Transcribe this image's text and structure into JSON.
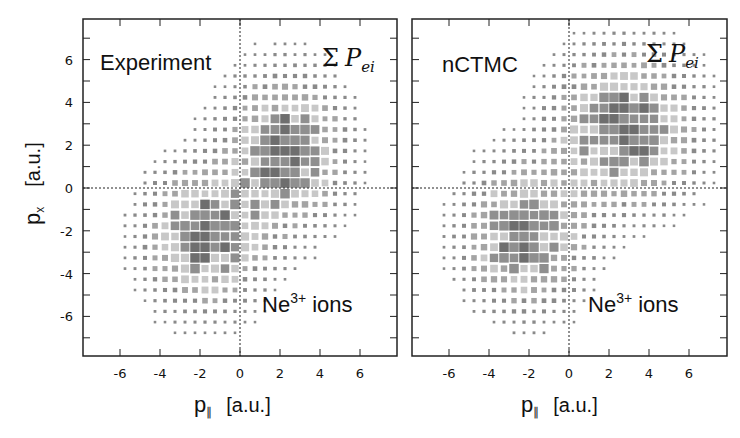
{
  "chart_data": [
    {
      "type": "heatmap",
      "title": "Experiment",
      "annotation_top": "Σ P_ei",
      "annotation_bottom": "Ne3+ ions",
      "xlabel": "p_∥ [a.u.]",
      "ylabel": "p_x [a.u.]",
      "xlim": [
        -8,
        8
      ],
      "ylim": [
        -8,
        8
      ],
      "xticks": [
        -6,
        -4,
        -2,
        0,
        2,
        4,
        6
      ],
      "yticks": [
        -6,
        -4,
        -2,
        0,
        2,
        4,
        6
      ],
      "bin_size": 0.5,
      "clusters": [
        {
          "center": [
            2.0,
            1.5
          ],
          "peak": [
            2.0,
            1.0
          ],
          "spread": [
            1.8,
            2.2
          ]
        },
        {
          "center": [
            -2.0,
            -2.5
          ],
          "peak": [
            -2.0,
            -2.5
          ],
          "spread": [
            1.8,
            2.0
          ]
        }
      ],
      "reference_lines": {
        "x": 0,
        "y": 0
      }
    },
    {
      "type": "heatmap",
      "title": "nCTMC",
      "annotation_top": "Σ P_ei",
      "annotation_bottom": "Ne3+ ions",
      "xlabel": "p_∥ [a.u.]",
      "ylabel": "",
      "xlim": [
        -8,
        8
      ],
      "ylim": [
        -8,
        8
      ],
      "xticks": [
        -6,
        -4,
        -2,
        0,
        2,
        4,
        6
      ],
      "bin_size": 0.5,
      "clusters": [
        {
          "center": [
            2.5,
            2.5
          ],
          "peak": [
            2.0,
            2.0
          ],
          "spread": [
            2.2,
            2.2
          ]
        },
        {
          "center": [
            -2.5,
            -2.5
          ],
          "peak": [
            -2.5,
            -2.5
          ],
          "spread": [
            1.8,
            2.0
          ]
        }
      ],
      "reference_lines": {
        "x": 0,
        "y": 0
      }
    }
  ],
  "labels": {
    "left_title": "Experiment",
    "right_title": "nCTMC",
    "sigma": "Σ",
    "p_letter": "P",
    "p_sub": "ei",
    "ion_text": "Ne",
    "ion_sup": "3+",
    "ion_suffix": " ions",
    "x_axis_var": "p",
    "x_axis_sub": "∥",
    "unit": "[a.u.]",
    "y_axis_var": "p",
    "y_axis_sub": "x"
  }
}
